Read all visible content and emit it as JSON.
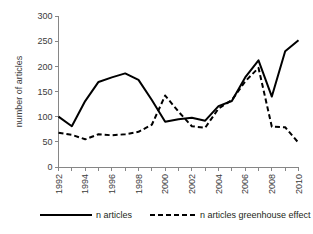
{
  "chart_data": {
    "type": "line",
    "title": "",
    "xlabel": "",
    "ylabel": "number of articles",
    "ylim": [
      0,
      300
    ],
    "yticks": [
      0,
      50,
      100,
      150,
      200,
      250,
      300
    ],
    "xlim": [
      1992,
      2010
    ],
    "x": [
      1992,
      1993,
      1994,
      1995,
      1996,
      1997,
      1998,
      1999,
      2000,
      2001,
      2002,
      2003,
      2004,
      2005,
      2006,
      2007,
      2008,
      2009,
      2010
    ],
    "xticks": [
      1992,
      1994,
      1996,
      1998,
      2000,
      2002,
      2004,
      2006,
      2008,
      2010
    ],
    "xtick_labels": [
      "1992",
      "1994",
      "1996",
      "1998",
      "2000",
      "2002",
      "2004",
      "2006",
      "2008",
      "2010"
    ],
    "grid": false,
    "legend_position": "bottom",
    "series": [
      {
        "name": "n articles",
        "style": "solid",
        "color": "#000000",
        "values": [
          100,
          81,
          131,
          169,
          178,
          186,
          173,
          133,
          90,
          95,
          98,
          92,
          121,
          131,
          178,
          212,
          140,
          230,
          252
        ]
      },
      {
        "name": "n articles greenhouse effect",
        "style": "dashed",
        "color": "#000000",
        "values": [
          68,
          64,
          55,
          65,
          63,
          65,
          70,
          84,
          142,
          110,
          81,
          78,
          116,
          133,
          170,
          197,
          80,
          79,
          48
        ]
      }
    ]
  },
  "legend": {
    "items": [
      {
        "label": "n articles",
        "style": "solid"
      },
      {
        "label": "n articles greenhouse effect",
        "style": "dashed"
      }
    ]
  }
}
